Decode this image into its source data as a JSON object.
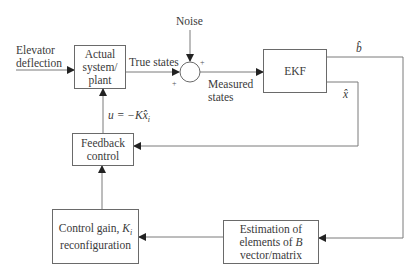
{
  "diagram": {
    "type": "block-diagram",
    "blocks": {
      "plant": {
        "label_lines": [
          "Actual",
          "system/",
          "plant"
        ]
      },
      "ekf": {
        "label": "EKF"
      },
      "feedback": {
        "label_lines": [
          "Feedback",
          "control"
        ]
      },
      "gain": {
        "label_main": "Control  gain, ",
        "label_var": "K",
        "label_sub": "i",
        "label_line2": "reconfiguration"
      },
      "estimation": {
        "label_line1": "Estimation of",
        "label_line2_pre": "elements of ",
        "label_line2_var": "B",
        "label_line3": "vector/matrix"
      }
    },
    "signals": {
      "input": [
        "Elevator",
        "deflection"
      ],
      "true_states": "True states",
      "noise": "Noise",
      "measured": [
        "Measured",
        "states"
      ],
      "b_hat": "b̂",
      "x_hat": "x̂",
      "control_law_pre": "u = −K",
      "control_law_var": "x̂",
      "control_law_sub": "i"
    },
    "summing_junction": {
      "signs": [
        "+",
        "+"
      ]
    },
    "colors": {
      "line": "#7a7a7a",
      "arrow": "#222222",
      "text": "#3a3a3a"
    }
  }
}
